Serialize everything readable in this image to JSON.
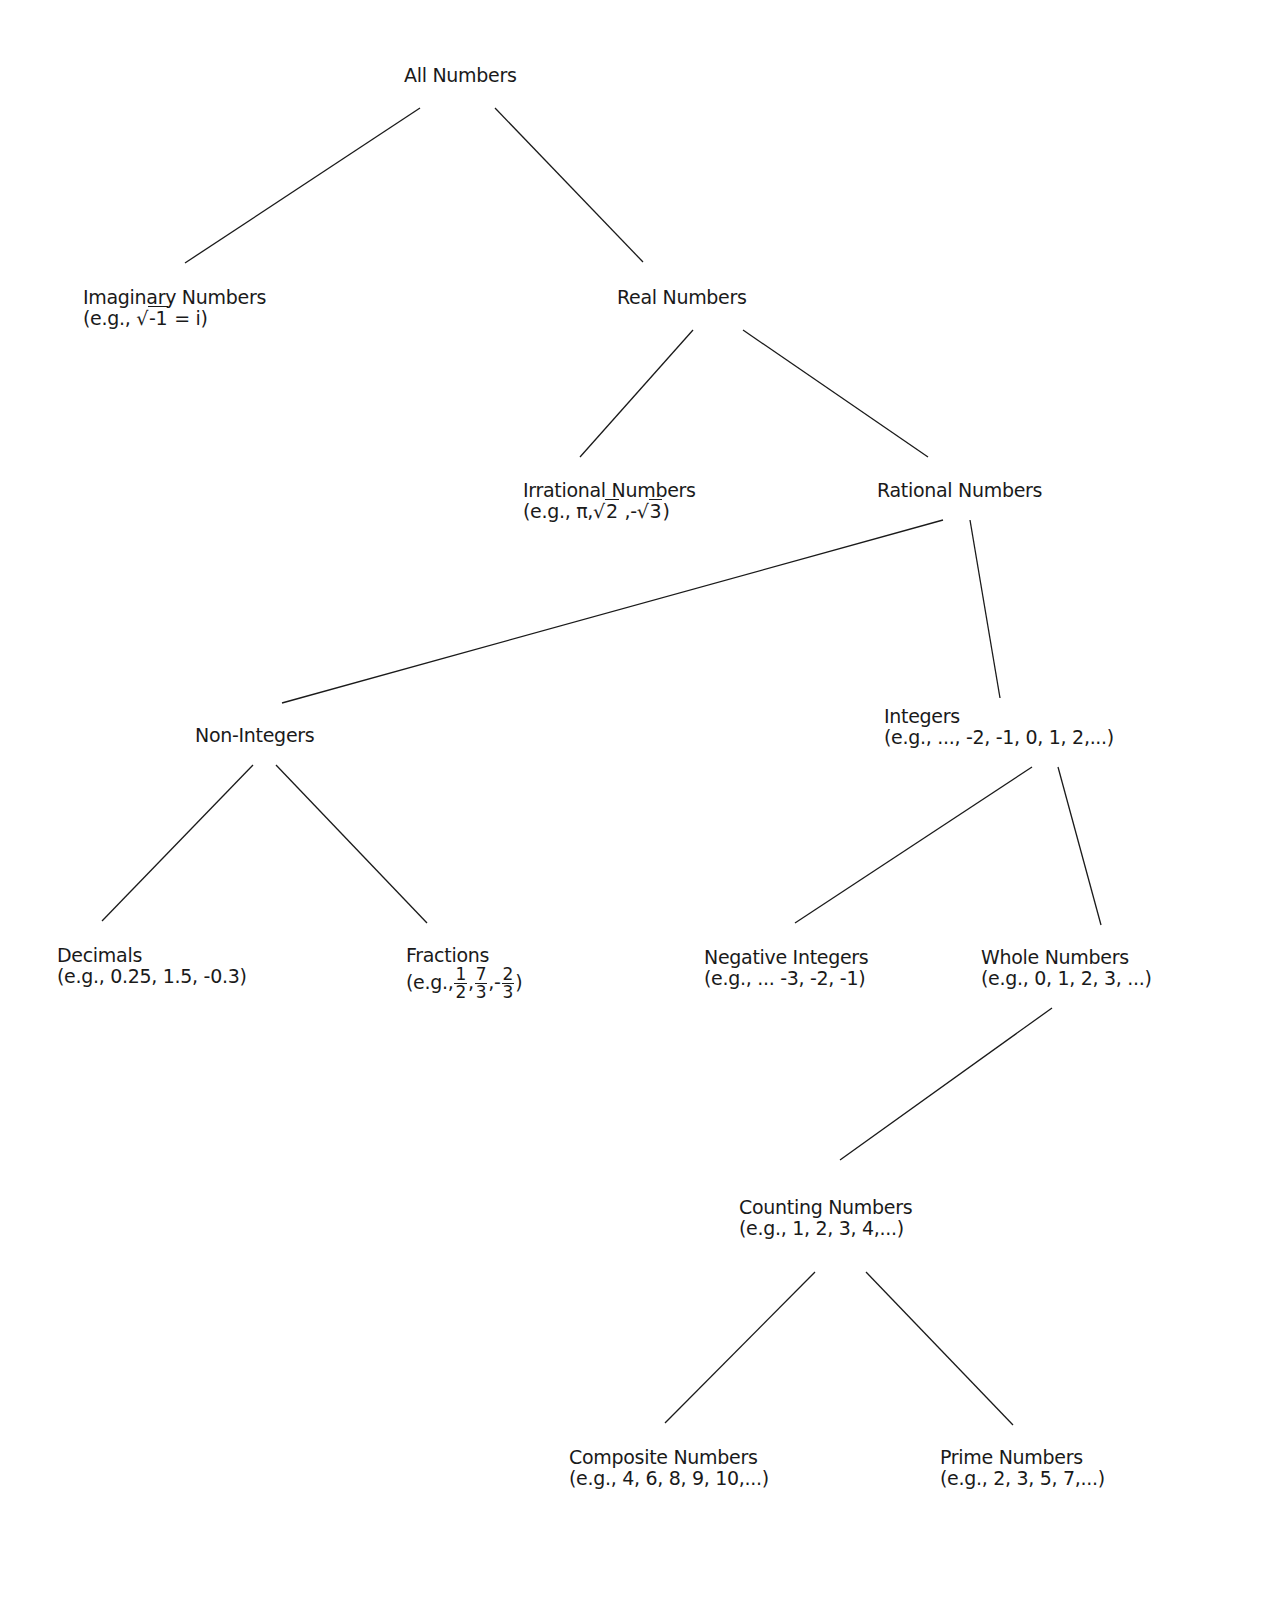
{
  "diagram": {
    "nodes": {
      "all": {
        "label": "All Numbers"
      },
      "imaginary": {
        "label": "Imaginary Numbers",
        "example_prefix": "(e.g., ",
        "example_radicand": "-1",
        "example_suffix": " = i)"
      },
      "real": {
        "label": "Real Numbers"
      },
      "irrational": {
        "label": "Irrational Numbers",
        "example_prefix": "(e.g., π,",
        "rad1": "2",
        "mid": " ,-",
        "rad2": "3",
        "example_suffix": ")"
      },
      "rational": {
        "label": "Rational Numbers"
      },
      "non_integers": {
        "label": "Non-Integers"
      },
      "integers": {
        "label": "Integers",
        "example": "(e.g., ..., -2, -1, 0, 1, 2,...)"
      },
      "decimals": {
        "label": "Decimals",
        "example": "(e.g., 0.25, 1.5, -0.3)"
      },
      "fractions": {
        "label": "Fractions",
        "example_prefix": "(e.g.,",
        "f1_num": "1",
        "f1_den": "2",
        "sep1": ",",
        "f2_num": "7",
        "f2_den": "3",
        "sep2": ",-",
        "f3_num": "2",
        "f3_den": "3",
        "example_suffix": ")"
      },
      "negative_integers": {
        "label": "Negative Integers",
        "example": "(e.g., ... -3, -2, -1)"
      },
      "whole": {
        "label": "Whole Numbers",
        "example": "(e.g., 0, 1, 2, 3, ...)"
      },
      "counting": {
        "label": "Counting Numbers",
        "example": "(e.g., 1, 2, 3, 4,...)"
      },
      "composite": {
        "label": "Composite Numbers",
        "example": "(e.g., 4, 6, 8, 9, 10,...)"
      },
      "prime": {
        "label": "Prime Numbers",
        "example": "(e.g., 2, 3, 5, 7,...)"
      }
    },
    "edges": [
      {
        "from": "All Numbers",
        "to": "Imaginary Numbers"
      },
      {
        "from": "All Numbers",
        "to": "Real Numbers"
      },
      {
        "from": "Real Numbers",
        "to": "Irrational Numbers"
      },
      {
        "from": "Real Numbers",
        "to": "Rational Numbers"
      },
      {
        "from": "Rational Numbers",
        "to": "Non-Integers"
      },
      {
        "from": "Rational Numbers",
        "to": "Integers"
      },
      {
        "from": "Non-Integers",
        "to": "Decimals"
      },
      {
        "from": "Non-Integers",
        "to": "Fractions"
      },
      {
        "from": "Integers",
        "to": "Negative Integers"
      },
      {
        "from": "Integers",
        "to": "Whole Numbers"
      },
      {
        "from": "Whole Numbers",
        "to": "Counting Numbers"
      },
      {
        "from": "Counting Numbers",
        "to": "Composite Numbers"
      },
      {
        "from": "Counting Numbers",
        "to": "Prime Numbers"
      }
    ]
  }
}
